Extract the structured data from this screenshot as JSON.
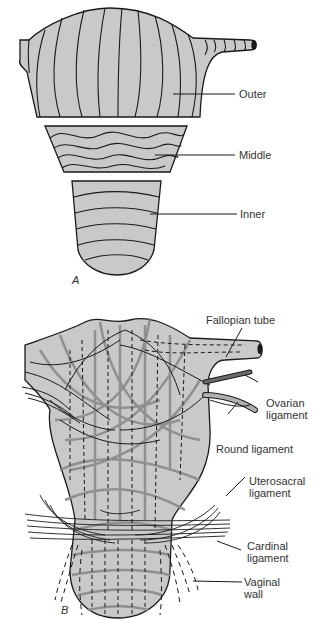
{
  "colors": {
    "fill": "#c9c9c9",
    "stroke": "#1a1a1a",
    "band": "#8a8a8a",
    "text": "#333333"
  },
  "panel_a": {
    "label": "A",
    "layers": [
      {
        "name": "Outer",
        "fiber_direction": "longitudinal"
      },
      {
        "name": "Middle",
        "fiber_direction": "interlacing"
      },
      {
        "name": "Inner",
        "fiber_direction": "circular"
      }
    ]
  },
  "panel_b": {
    "label": "B",
    "labels": [
      {
        "text": "Fallopian tube"
      },
      {
        "text": "Ovarian",
        "text2": "ligament"
      },
      {
        "text": "Round ligament"
      },
      {
        "text": "Uterosacral",
        "text2": "ligament"
      },
      {
        "text": "Cardinal",
        "text2": "ligament"
      },
      {
        "text": "Vaginal",
        "text2": "wall"
      }
    ]
  }
}
